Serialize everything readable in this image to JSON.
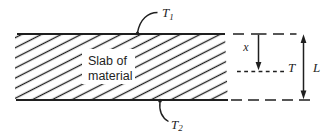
{
  "figure": {
    "slab": {
      "line1": "Slab of",
      "line2": "material"
    },
    "labels": {
      "t1": {
        "base": "T",
        "sub": "1"
      },
      "t2": {
        "base": "T",
        "sub": "2"
      },
      "x": "x",
      "t": "T",
      "l": "L"
    },
    "colors": {
      "ink": "#1f1f1f",
      "paper": "#ffffff"
    }
  }
}
